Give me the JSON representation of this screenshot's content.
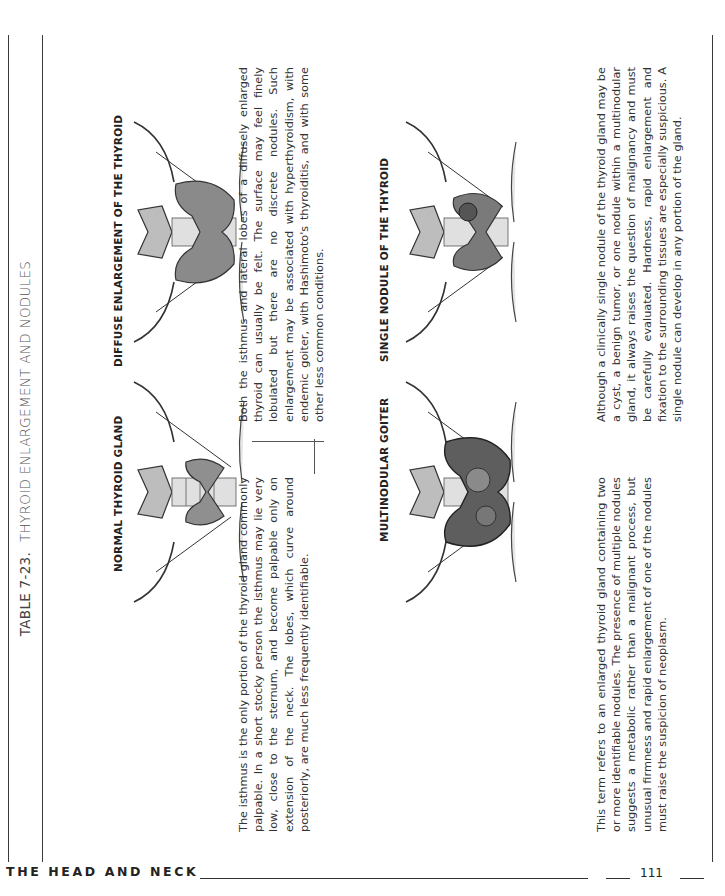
{
  "table": {
    "number": "TABLE 7-23.",
    "title": "THYROID ENLARGEMENT AND NODULES"
  },
  "panels": [
    {
      "heading": "NORMAL THYROID GLAND",
      "illustration": "normal-thyroid-illustration",
      "text": "The isthmus is the only portion of the thyroid gland commonly palpable. In a short stocky person the isthmus may lie very low, close to the sternum, and become palpable only on extension of the neck. The lobes, which curve around posteriorly, are much less frequently identifiable."
    },
    {
      "heading": "DIFFUSE ENLARGEMENT OF THE THYROID",
      "illustration": "diffuse-enlargement-illustration",
      "text": "Both the isthmus and lateral lobes of a diffusely enlarged thyroid can usually be felt. The surface may feel finely lobulated but there are no discrete nodules. Such enlargement may be associated with hyperthyroidism, with endemic goiter, with Hashimoto's thyroiditis, and with some other less common conditions."
    },
    {
      "heading": "MULTINODULAR GOITER",
      "illustration": "multinodular-goiter-illustration",
      "text": "This term refers to an enlarged thyroid gland containing two or more identifiable nodules. The presence of multiple nodules suggests a metabolic rather than a malignant process, but unusual firmness and rapid enlargement of one of the nodules must raise the suspicion of neoplasm."
    },
    {
      "heading": "SINGLE NODULE OF THE THYROID",
      "illustration": "single-nodule-illustration",
      "text": "Although a clinically single nodule of the thyroid gland may be a cyst, a benign tumor, or one nodule within a multinodular gland, it always raises the question of malignancy and must be carefully evaluated. Hardness, rapid enlargement and fixation to the surrounding tissues are especially suspicious. A single nodule can develop in any portion of the gland."
    }
  ],
  "footer": {
    "section": "THE HEAD AND NECK",
    "page_number": "111"
  }
}
